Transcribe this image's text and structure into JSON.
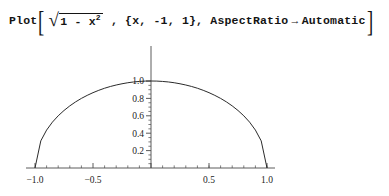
{
  "input_cell": {
    "function_name": "Plot",
    "open_bracket": "[",
    "close_bracket": "]",
    "radical_symbol": "√",
    "radicand_main": "1 - x",
    "radicand_exponent": "2",
    "separator_1": " , ",
    "iterator": "{x, -1, 1}",
    "separator_2": ", ",
    "option_name": "AspectRatio",
    "option_arrow": "→",
    "option_value": "Automatic"
  },
  "chart_data": {
    "type": "line",
    "title": "",
    "xlabel": "",
    "ylabel": "",
    "expression": "Sqrt[1 - x^2]",
    "xlim": [
      -1.09,
      1.09
    ],
    "ylim": [
      0,
      1.06
    ],
    "grid": false,
    "legend": false,
    "aspect_ratio": "Automatic",
    "line_color": "#2b2b2b",
    "axis_color": "#4a4a4a",
    "x_ticks_major": [
      "-1.0",
      "-0.5",
      "0.5",
      "1.0"
    ],
    "x_tick_values": [
      -1.0,
      -0.5,
      0.5,
      1.0
    ],
    "y_ticks_major": [
      "0.2",
      "0.4",
      "0.6",
      "0.8",
      "1.0"
    ],
    "y_tick_values": [
      0.2,
      0.4,
      0.6,
      0.8,
      1.0
    ],
    "x_minor_count_per_interval": 4,
    "y_minor_count_per_interval": 4,
    "x": [
      -1.0,
      -0.95,
      -0.9,
      -0.85,
      -0.8,
      -0.75,
      -0.7,
      -0.65,
      -0.6,
      -0.55,
      -0.5,
      -0.45,
      -0.4,
      -0.35,
      -0.3,
      -0.25,
      -0.2,
      -0.15,
      -0.1,
      -0.05,
      0.0,
      0.05,
      0.1,
      0.15,
      0.2,
      0.25,
      0.3,
      0.35,
      0.4,
      0.45,
      0.5,
      0.55,
      0.6,
      0.65,
      0.7,
      0.75,
      0.8,
      0.85,
      0.9,
      0.95,
      1.0
    ],
    "y": [
      0.0,
      0.312,
      0.436,
      0.527,
      0.6,
      0.661,
      0.714,
      0.76,
      0.8,
      0.835,
      0.866,
      0.893,
      0.917,
      0.937,
      0.954,
      0.968,
      0.98,
      0.989,
      0.995,
      0.999,
      1.0,
      0.999,
      0.995,
      0.989,
      0.98,
      0.968,
      0.954,
      0.937,
      0.917,
      0.893,
      0.866,
      0.835,
      0.8,
      0.76,
      0.714,
      0.661,
      0.6,
      0.527,
      0.436,
      0.312,
      0.0
    ]
  }
}
